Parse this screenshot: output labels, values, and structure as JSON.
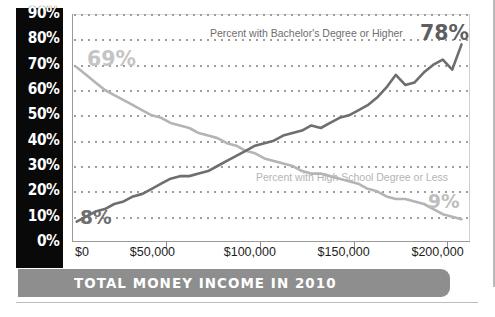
{
  "banner": {
    "title": "TOTAL MONEY INCOME IN 2010"
  },
  "axis": {
    "y_ticks": [
      "90%",
      "80%",
      "70%",
      "60%",
      "50%",
      "40%",
      "30%",
      "20%",
      "10%",
      "0%"
    ],
    "x_ticks": [
      "$0",
      "$50,000",
      "$100,000",
      "$150,000",
      "$200,000"
    ]
  },
  "annotations": {
    "bachelor_label": "Percent with Bachelor's Degree or Higher",
    "highschool_label": "Percent with High School Degree or Less",
    "bachelor_end": "78%",
    "bachelor_start": "8%",
    "highschool_start": "69%",
    "highschool_end": "9%"
  },
  "colors": {
    "bachelor_line": "#6e6e6e",
    "highschool_line": "#b4b4b4",
    "axis_bar": "#090909",
    "banner": "#8e8e8e",
    "gridline": "#9e9e9e"
  },
  "chart_data": {
    "type": "line",
    "title": "TOTAL MONEY INCOME IN 2010",
    "xlabel": "Total money income in 2010",
    "ylabel": "Percent",
    "xlim": [
      0,
      212000
    ],
    "ylim": [
      0,
      90
    ],
    "grid": true,
    "legend": "inline-annotations",
    "x": [
      2500,
      7500,
      12500,
      17500,
      22500,
      27500,
      32500,
      37500,
      42500,
      47500,
      52500,
      57500,
      62500,
      67500,
      72500,
      77500,
      82500,
      87500,
      92500,
      97500,
      102500,
      107500,
      112500,
      117500,
      122500,
      127500,
      132500,
      137500,
      142500,
      147500,
      152500,
      157500,
      162500,
      167500,
      172500,
      177500,
      182500,
      187500,
      192500,
      197500,
      202500,
      207500
    ],
    "series": [
      {
        "name": "Percent with Bachelor's Degree or Higher",
        "color": "#6e6e6e",
        "start_label": "8%",
        "end_label": "78%",
        "values": [
          8,
          10,
          12,
          13,
          15,
          16,
          18,
          19,
          21,
          23,
          25,
          26,
          26,
          27,
          28,
          30,
          32,
          34,
          36,
          38,
          39,
          40,
          42,
          43,
          44,
          46,
          45,
          47,
          49,
          50,
          52,
          54,
          57,
          61,
          66,
          62,
          63,
          67,
          70,
          72,
          68,
          78
        ]
      },
      {
        "name": "Percent with High School Degree or Less",
        "color": "#b4b4b4",
        "start_label": "69%",
        "end_label": "9%",
        "values": [
          69,
          66,
          63,
          60,
          58,
          56,
          54,
          52,
          50,
          49,
          47,
          46,
          45,
          43,
          42,
          41,
          39,
          38,
          36,
          35,
          33,
          32,
          31,
          30,
          28,
          27,
          27,
          26,
          25,
          24,
          23,
          21,
          20,
          18,
          17,
          17,
          16,
          15,
          13,
          11,
          10,
          9
        ]
      }
    ]
  }
}
